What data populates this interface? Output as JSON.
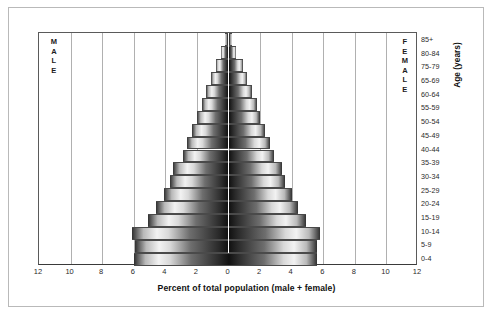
{
  "chart_data": {
    "type": "bar",
    "subtype": "population-pyramid",
    "title": "",
    "xlabel": "Percent of total population (male + female)",
    "ylabel": "Age (years)",
    "xlim": [
      -12,
      12
    ],
    "xticks": [
      12,
      10,
      8,
      6,
      4,
      2,
      0,
      2,
      4,
      6,
      8,
      10,
      12
    ],
    "xtick_values": [
      -12,
      -10,
      -8,
      -6,
      -4,
      -2,
      0,
      2,
      4,
      6,
      8,
      10,
      12
    ],
    "grid": true,
    "grid_axis": "x",
    "legend": "none",
    "side_labels": {
      "left": "MALE",
      "right": "FEMALE"
    },
    "categories": [
      "0-4",
      "5-9",
      "10-14",
      "15-19",
      "20-24",
      "25-29",
      "30-34",
      "35-39",
      "40-44",
      "45-49",
      "50-54",
      "55-59",
      "60-64",
      "65-69",
      "70-74",
      "75-79",
      "80-84",
      "85+"
    ],
    "axis_tick_labels": [
      "85+",
      "80-84",
      "75-79",
      "65-69",
      "60-64",
      "55-59",
      "50-54",
      "45-49",
      "40-44",
      "35-39",
      "30-34",
      "25-29",
      "20-24",
      "15-19",
      "10-14",
      "5-9",
      "0-4"
    ],
    "series": [
      {
        "name": "MALE",
        "side": "left",
        "values": [
          6.0,
          5.9,
          6.1,
          5.1,
          4.6,
          4.1,
          3.7,
          3.5,
          2.9,
          2.6,
          2.3,
          2.0,
          1.7,
          1.4,
          1.1,
          0.8,
          0.45,
          0.2
        ]
      },
      {
        "name": "FEMALE",
        "side": "right",
        "values": [
          5.6,
          5.6,
          5.8,
          4.9,
          4.4,
          4.0,
          3.6,
          3.4,
          2.9,
          2.6,
          2.3,
          2.0,
          1.8,
          1.5,
          1.2,
          0.9,
          0.5,
          0.25
        ]
      }
    ]
  },
  "colors": {
    "frame": "#b9b9b9",
    "axis": "#5a5a5a",
    "gridline": "#b0b0b0",
    "centerline": "#8a8a8a",
    "bar_dark": "#111111",
    "bar_light": "#f2f2f2",
    "text": "#1b1b1b",
    "background": "#ffffff"
  }
}
